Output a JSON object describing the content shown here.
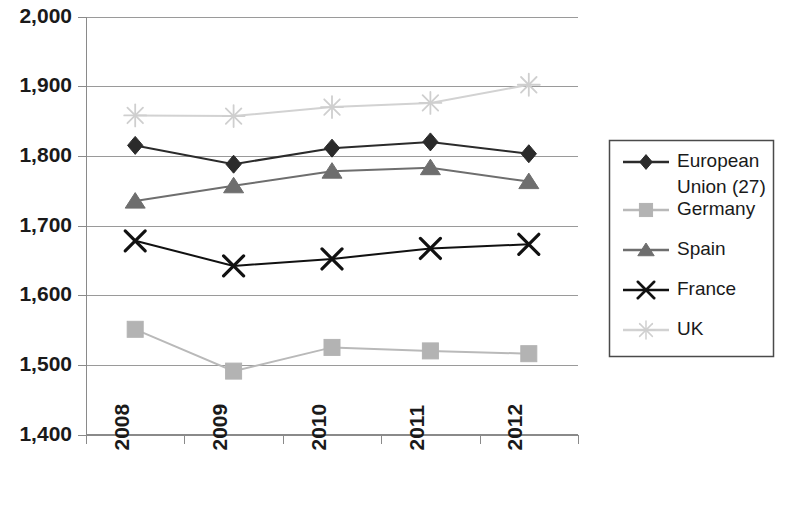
{
  "chart_data": {
    "type": "line",
    "title": "",
    "subtitle": "",
    "xlabel": "",
    "ylabel": "",
    "categories": [
      "2008",
      "2009",
      "2010",
      "2011",
      "2012"
    ],
    "ylim": [
      1400,
      2000
    ],
    "yticks": [
      1400,
      1500,
      1600,
      1700,
      1800,
      1900,
      2000
    ],
    "ytick_labels": [
      "1,400",
      "1,500",
      "1,600",
      "1,700",
      "1,800",
      "1,900",
      "2,000"
    ],
    "grid": true,
    "legend_position": "right",
    "series": [
      {
        "name": "European Union (27)",
        "marker": "diamond",
        "color": "#2b2b2b",
        "line_color": "#2b2b2b",
        "values": [
          1815,
          1788,
          1811,
          1820,
          1803
        ]
      },
      {
        "name": "Germany",
        "marker": "square",
        "color": "#b3b3b3",
        "line_color": "#b9b9b9",
        "values": [
          1551,
          1491,
          1525,
          1520,
          1516
        ]
      },
      {
        "name": "Spain",
        "marker": "triangle",
        "color": "#6e6e6e",
        "line_color": "#6e6e6e",
        "values": [
          1735,
          1757,
          1778,
          1783,
          1763
        ]
      },
      {
        "name": "France",
        "marker": "x",
        "color": "#111111",
        "line_color": "#111111",
        "values": [
          1678,
          1642,
          1652,
          1667,
          1673
        ]
      },
      {
        "name": "UK",
        "marker": "asterisk",
        "color": "#cfcfcf",
        "line_color": "#d2d2d2",
        "values": [
          1858,
          1857,
          1870,
          1876,
          1902
        ]
      }
    ]
  },
  "legend": {
    "entries": [
      {
        "label_line1": "European",
        "label_line2": "Union (27)"
      },
      {
        "label_line1": "Germany",
        "label_line2": ""
      },
      {
        "label_line1": "Spain",
        "label_line2": ""
      },
      {
        "label_line1": "France",
        "label_line2": ""
      },
      {
        "label_line1": "UK",
        "label_line2": ""
      }
    ]
  }
}
